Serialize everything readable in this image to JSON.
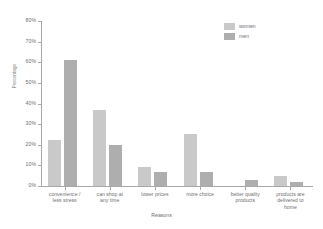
{
  "chart_data": {
    "type": "bar",
    "title": "",
    "xlabel": "Reasons",
    "ylabel": "Percentage",
    "ylim": [
      0,
      80
    ],
    "ytick_labels": [
      "0%",
      "10%",
      "20%",
      "30%",
      "40%",
      "50%",
      "60%",
      "70%",
      "80%"
    ],
    "ytick_values": [
      0,
      10,
      20,
      30,
      40,
      50,
      60,
      70,
      80
    ],
    "grid": false,
    "legend_position": "top-right",
    "categories": [
      "convenience / less stress",
      "can shop at any time",
      "lower prices",
      "more choice",
      "better quality products",
      "products are delivered to home"
    ],
    "category_lines": [
      [
        "convenience /",
        "less stress"
      ],
      [
        "can shop at",
        "any time"
      ],
      [
        "lower prices"
      ],
      [
        "more choice"
      ],
      [
        "better quality",
        "products"
      ],
      [
        "products are",
        "delivered to",
        "home"
      ]
    ],
    "series": [
      {
        "name": "women",
        "color": "#c9c9c9",
        "values": [
          22.5,
          37,
          9,
          25,
          0,
          5
        ]
      },
      {
        "name": "men",
        "color": "#aeaeae",
        "values": [
          61,
          20,
          7,
          7,
          3,
          2
        ]
      }
    ]
  },
  "legend": {
    "items": [
      {
        "label": "women"
      },
      {
        "label": "men"
      }
    ]
  },
  "colors": {
    "women": "#c9c9c9",
    "men": "#aeaeae",
    "axis": "#a8a8a8",
    "text": "#6f6f6f",
    "background": "#ffffff"
  }
}
